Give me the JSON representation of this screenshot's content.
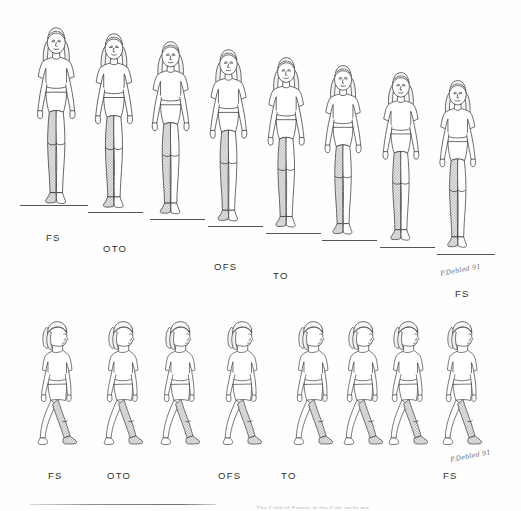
{
  "figure": {
    "background_color": "#fefefe",
    "ink_color": "#2e2e2e",
    "shade_color": "#9a9a9a",
    "signature": "P.Debled 91",
    "caption_cut_text": "The Critical Events in the Gait cycle are"
  },
  "rows": [
    {
      "id": "frontal-row",
      "view": "frontal",
      "frame_count": 8,
      "frames": [
        {
          "index": 1,
          "x": 27,
          "y": 22,
          "height": 195,
          "shaded_leg": "left",
          "ground_y": 205,
          "ground_x": 20,
          "ground_w": 68
        },
        {
          "index": 2,
          "x": 85,
          "y": 28,
          "height": 193,
          "shaded_leg": "left",
          "ground_y": 212,
          "ground_x": 88,
          "ground_w": 55
        },
        {
          "index": 3,
          "x": 142,
          "y": 36,
          "height": 191,
          "shaded_leg": "left",
          "ground_y": 219,
          "ground_x": 150,
          "ground_w": 55
        },
        {
          "index": 4,
          "x": 200,
          "y": 44,
          "height": 190,
          "shaded_leg": "left",
          "ground_y": 226,
          "ground_x": 208,
          "ground_w": 55
        },
        {
          "index": 5,
          "x": 258,
          "y": 52,
          "height": 188,
          "shaded_leg": "left",
          "ground_y": 233,
          "ground_x": 266,
          "ground_w": 55
        },
        {
          "index": 6,
          "x": 315,
          "y": 60,
          "height": 187,
          "shaded_leg": "left",
          "ground_y": 240,
          "ground_x": 322,
          "ground_w": 55
        },
        {
          "index": 7,
          "x": 373,
          "y": 67,
          "height": 186,
          "shaded_leg": "left",
          "ground_y": 247,
          "ground_x": 380,
          "ground_w": 55
        },
        {
          "index": 8,
          "x": 430,
          "y": 75,
          "height": 185,
          "shaded_leg": "left",
          "ground_y": 254,
          "ground_x": 437,
          "ground_w": 58
        }
      ],
      "labels": [
        {
          "text": "FS",
          "x": 46,
          "y": 232
        },
        {
          "text": "OTO",
          "x": 103,
          "y": 243
        },
        {
          "text": "OFS",
          "x": 214,
          "y": 261
        },
        {
          "text": "TO",
          "x": 273,
          "y": 270
        },
        {
          "text": "FS",
          "x": 455,
          "y": 288
        }
      ]
    },
    {
      "id": "sagittal-row",
      "view": "sagittal",
      "frame_count": 8,
      "frames": [
        {
          "index": 1,
          "x": 32,
          "y": 318,
          "height": 133,
          "shaded_leg": "near",
          "ground_y": 451,
          "ground_x": 30,
          "ground_w": 0
        },
        {
          "index": 2,
          "x": 98,
          "y": 318,
          "height": 133,
          "shaded_leg": "near",
          "ground_y": 451,
          "ground_x": 96,
          "ground_w": 0
        },
        {
          "index": 3,
          "x": 155,
          "y": 318,
          "height": 133,
          "shaded_leg": "near",
          "ground_y": 451,
          "ground_x": 153,
          "ground_w": 0
        },
        {
          "index": 4,
          "x": 217,
          "y": 318,
          "height": 133,
          "shaded_leg": "near",
          "ground_y": 451,
          "ground_x": 215,
          "ground_w": 0
        },
        {
          "index": 5,
          "x": 288,
          "y": 318,
          "height": 133,
          "shaded_leg": "near",
          "ground_y": 451,
          "ground_x": 286,
          "ground_w": 0
        },
        {
          "index": 6,
          "x": 338,
          "y": 318,
          "height": 133,
          "shaded_leg": "near",
          "ground_y": 451,
          "ground_x": 336,
          "ground_w": 0
        },
        {
          "index": 7,
          "x": 383,
          "y": 318,
          "height": 133,
          "shaded_leg": "near",
          "ground_y": 451,
          "ground_x": 381,
          "ground_w": 0
        },
        {
          "index": 8,
          "x": 437,
          "y": 318,
          "height": 133,
          "shaded_leg": "near",
          "ground_y": 451,
          "ground_x": 435,
          "ground_w": 0
        }
      ],
      "labels": [
        {
          "text": "FS",
          "x": 48,
          "y": 470
        },
        {
          "text": "OTO",
          "x": 107,
          "y": 470
        },
        {
          "text": "OFS",
          "x": 218,
          "y": 470
        },
        {
          "text": "TO",
          "x": 281,
          "y": 470
        },
        {
          "text": "FS",
          "x": 443,
          "y": 470
        }
      ]
    }
  ],
  "gait_events": {
    "FS": "Foot Strike",
    "OTO": "Opposite Toe Off",
    "OFS": "Opposite Foot Strike",
    "TO": "Toe Off"
  },
  "signatures": [
    {
      "text": "P.Debled 91",
      "x": 440,
      "y": 266
    },
    {
      "text": "P.Debled 91",
      "x": 450,
      "y": 452
    }
  ],
  "caption_rule": {
    "x": 30,
    "y": 504,
    "width": 186
  },
  "caption_cut": {
    "x": 256,
    "y": 505,
    "width": 262
  }
}
